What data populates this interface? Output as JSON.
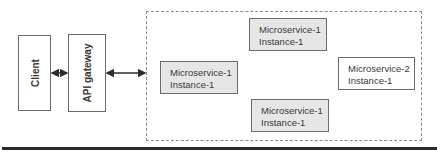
{
  "diagram": {
    "client": {
      "label": "Client"
    },
    "gateway": {
      "label": "API gateway"
    },
    "container": {
      "label": ""
    },
    "services": [
      {
        "name": "Microservice-1",
        "instance": "Instance-1",
        "fill": "#e6e6e6"
      },
      {
        "name": "Microservice-1",
        "instance": "Instance-1",
        "fill": "#e6e6e6"
      },
      {
        "name": "Microservice-1",
        "instance": "Instance-1",
        "fill": "#e6e6e6"
      },
      {
        "name": "Microservice-2",
        "instance": "Instance-1",
        "fill": "#ffffff"
      }
    ],
    "edges": [
      {
        "from": "Client",
        "to": "API gateway",
        "direction": "bidirectional"
      },
      {
        "from": "API gateway",
        "to": "microservice-container",
        "direction": "bidirectional"
      }
    ]
  }
}
